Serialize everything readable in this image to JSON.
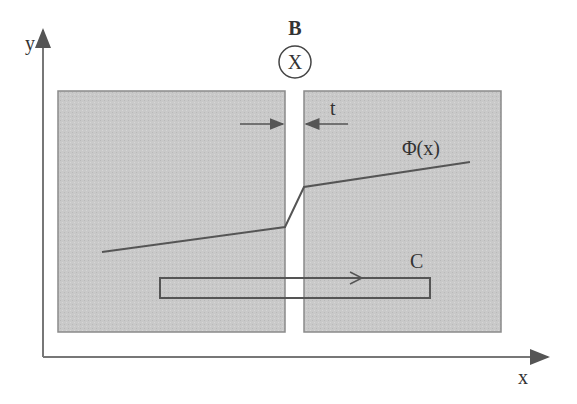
{
  "diagram": {
    "axes": {
      "x_label": "x",
      "y_label": "y"
    },
    "field": {
      "label": "B",
      "symbol": "X",
      "direction": "into-page"
    },
    "gap": {
      "label": "t"
    },
    "potential": {
      "label": "Φ(x)"
    },
    "loop": {
      "label": "C"
    },
    "colors": {
      "region_fill": "#c8c8c8",
      "region_border": "#8a8a8a",
      "line": "#555555",
      "axis": "#777777",
      "background": "#ffffff"
    }
  }
}
